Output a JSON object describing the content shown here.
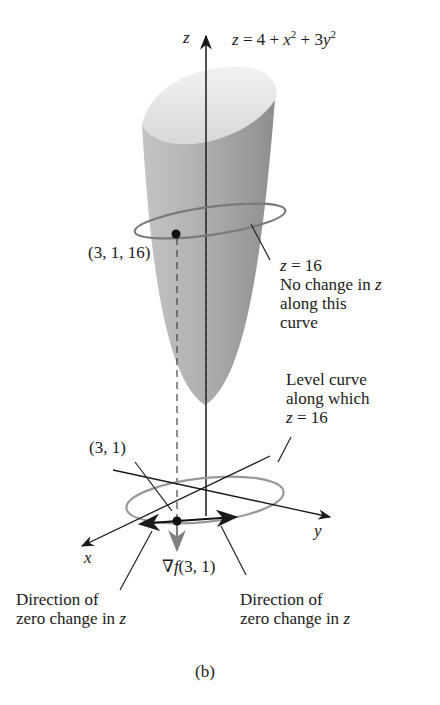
{
  "figure": {
    "surface_equation": {
      "lhs": "z",
      "eq": " = 4 + ",
      "x": "x",
      "x_exp": "2",
      "plus": " + 3",
      "y": "y",
      "y_exp": "2"
    },
    "z_axis_label": "z",
    "x_axis_label": "x",
    "y_axis_label": "y",
    "point_3d_label": "(3, 1, 16)",
    "contour_label": {
      "z": "z",
      "eq": " = 16",
      "line2": "No change in ",
      "line2_var": "z",
      "line3": "along this",
      "line4": "curve"
    },
    "level_curve_label": {
      "line1": "Level curve",
      "line2": "along which",
      "z": "z",
      "eq": " = 16"
    },
    "point_2d_label": "(3, 1)",
    "gradient_label": {
      "nabla": "∇",
      "f": "f",
      "args": "(3, 1)"
    },
    "direction_left": {
      "line1": "Direction of",
      "line2": "zero change in ",
      "var": "z"
    },
    "direction_right": {
      "line1": "Direction of",
      "line2": "zero change in ",
      "var": "z"
    },
    "caption": "(b)"
  },
  "colors": {
    "surface_light": "#e6e6e6",
    "surface_dark": "#9a9a9a",
    "curve_gray": "#8a8a8a",
    "ink": "#1a1a1a"
  }
}
